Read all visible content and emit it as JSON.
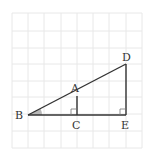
{
  "diagram": {
    "type": "geometry-similar-right-triangles",
    "grid": {
      "x_lines": [
        12,
        28,
        44,
        61,
        77,
        93,
        109,
        126,
        142
      ],
      "y_lines": [
        13,
        31,
        48,
        64,
        81,
        97,
        114,
        131,
        148
      ],
      "color": "#e8e8e8"
    },
    "line_color": "#333333",
    "angle_fill": "#b8b8b8",
    "points": {
      "A": {
        "label": "A",
        "x": 77,
        "y": 96
      },
      "B": {
        "label": "B",
        "x": 28,
        "y": 115
      },
      "C": {
        "label": "C",
        "x": 77,
        "y": 115
      },
      "D": {
        "label": "D",
        "x": 126,
        "y": 64
      },
      "E": {
        "label": "E",
        "x": 126,
        "y": 115
      }
    },
    "segments": [
      "BD",
      "BE",
      "AC",
      "DE"
    ],
    "right_angles": [
      "C",
      "E"
    ],
    "marked_angle": "B"
  }
}
